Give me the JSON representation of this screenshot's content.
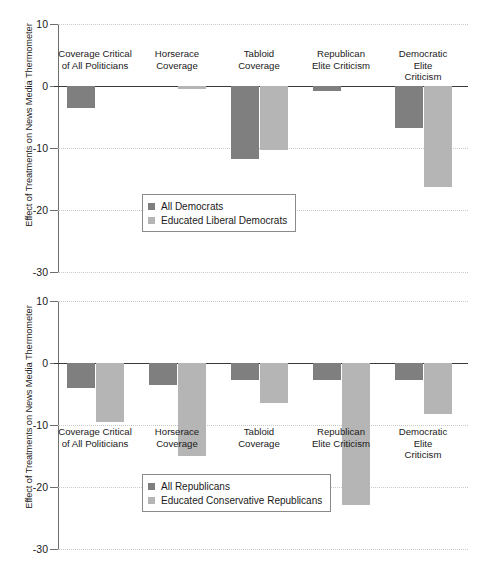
{
  "figure": {
    "background": "#ffffff",
    "colors": {
      "dark": "#7f7f7f",
      "light": "#b5b5b5",
      "axis": "#3a3a3a",
      "grid": "#c9c9c9"
    }
  },
  "chart_data": [
    {
      "type": "bar",
      "panel": "top",
      "title": "",
      "xlabel": "",
      "ylabel": "Effect of Treatments on News Media Thermometer",
      "ylim": [
        -30,
        10
      ],
      "yticks": [
        10,
        0,
        -10,
        -20,
        -30
      ],
      "ytick_labels": [
        "10",
        "0",
        "-10",
        "-20",
        "-30"
      ],
      "grid": true,
      "legend_position": "lower-center-left",
      "categories": [
        "Coverage Critical\nof All Politicians",
        "Horserace\nCoverage",
        "Tabloid\nCoverage",
        "Republican\nElite Criticism",
        "Democratic\nElite Criticism"
      ],
      "series": [
        {
          "name": "All Democrats",
          "color": "#7f7f7f",
          "values": [
            -3.5,
            0.0,
            -11.8,
            -0.8,
            -6.8
          ]
        },
        {
          "name": "Educated Liberal Democrats",
          "color": "#b5b5b5",
          "values": [
            0.0,
            -0.5,
            -10.4,
            0.0,
            -16.3
          ]
        }
      ]
    },
    {
      "type": "bar",
      "panel": "bottom",
      "title": "",
      "xlabel": "",
      "ylabel": "Effect of Treatments on News Media Thermometer",
      "ylim": [
        -30,
        10
      ],
      "yticks": [
        10,
        0,
        -10,
        -20,
        -30
      ],
      "ytick_labels": [
        "10",
        "0",
        "-10",
        "-20",
        "-30"
      ],
      "grid": true,
      "legend_position": "lower-center-left",
      "categories": [
        "Coverage Critical\nof All Politicians",
        "Horserace\nCoverage",
        "Tabloid\nCoverage",
        "Republican\nElite Criticism",
        "Democratic\nElite Criticism"
      ],
      "series": [
        {
          "name": "All Republicans",
          "color": "#7f7f7f",
          "values": [
            -4.0,
            -3.6,
            -2.7,
            -2.8,
            -2.7
          ]
        },
        {
          "name": "Educated Conservative Republicans",
          "color": "#b5b5b5",
          "values": [
            -9.5,
            -15.0,
            -6.5,
            -22.9,
            -8.3
          ]
        }
      ]
    }
  ]
}
